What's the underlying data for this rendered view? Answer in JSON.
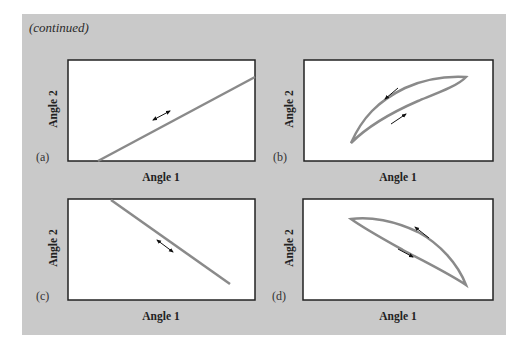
{
  "header": {
    "continued_label": "(continued)"
  },
  "colors": {
    "background": "#c9c9c9",
    "plot_bg": "#ffffff",
    "frame": "#222222",
    "curve": "#8a8a8a",
    "arrow": "#111111"
  },
  "panels": [
    {
      "id": "a",
      "label": "(a)",
      "xlabel": "Angle 1",
      "ylabel": "Angle 2",
      "shape": "line-positive-slope",
      "arrow": "double-headed along line"
    },
    {
      "id": "b",
      "label": "(b)",
      "xlabel": "Angle 1",
      "ylabel": "Angle 2",
      "shape": "closed-loop-positive-slope",
      "arrow": "counterclockwise loop (upper arc down-left, lower arc up-right)"
    },
    {
      "id": "c",
      "label": "(c)",
      "xlabel": "Angle 1",
      "ylabel": "Angle 2",
      "shape": "line-negative-slope",
      "arrow": "double-headed along line"
    },
    {
      "id": "d",
      "label": "(d)",
      "xlabel": "Angle 1",
      "ylabel": "Angle 2",
      "shape": "closed-loop-negative-slope",
      "arrow": "loop (upper arc up-left, lower arc down-right)"
    }
  ]
}
